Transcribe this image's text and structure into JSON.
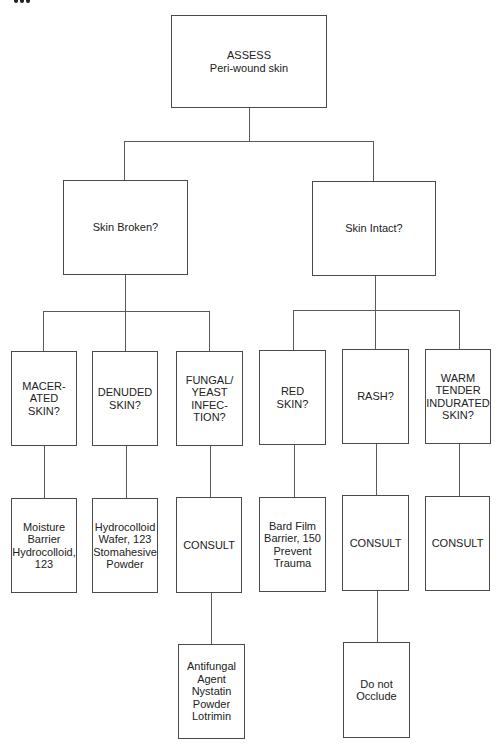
{
  "diagram": {
    "type": "flowchart",
    "title_fragment": "cropped text (illegible)",
    "nodes": [
      {
        "id": "assess",
        "label": "ASSESS\nPeri-wound skin",
        "level": 0
      },
      {
        "id": "skin_broken",
        "label": "Skin Broken?",
        "level": 1,
        "parent": "assess"
      },
      {
        "id": "skin_intact",
        "label": "Skin Intact?",
        "level": 1,
        "parent": "assess"
      },
      {
        "id": "macerated",
        "label": "MACER-\nATED\nSKIN?",
        "level": 2,
        "parent": "skin_broken"
      },
      {
        "id": "denuded",
        "label": "DENUDED\nSKIN?",
        "level": 2,
        "parent": "skin_broken"
      },
      {
        "id": "fungal",
        "label": "FUNGAL/\nYEAST\nINFEC-\nTION?",
        "level": 2,
        "parent": "skin_broken"
      },
      {
        "id": "red",
        "label": "RED\nSKIN?",
        "level": 2,
        "parent": "skin_intact"
      },
      {
        "id": "rash",
        "label": "RASH?",
        "level": 2,
        "parent": "skin_intact"
      },
      {
        "id": "warm",
        "label": "WARM\nTENDER\nINDURATED\nSKIN?",
        "level": 2,
        "parent": "skin_intact"
      },
      {
        "id": "moisture",
        "label": "Moisture\nBarrier\nHydrocolloid,\n123",
        "level": 3,
        "parent": "macerated"
      },
      {
        "id": "hydrocolloid",
        "label": "Hydrocolloid\nWafer, 123\nStomahesive\nPowder",
        "level": 3,
        "parent": "denuded"
      },
      {
        "id": "consult_fungal",
        "label": "CONSULT",
        "level": 3,
        "parent": "fungal"
      },
      {
        "id": "bard",
        "label": "Bard Film\nBarrier, 150\nPrevent\nTrauma",
        "level": 3,
        "parent": "red"
      },
      {
        "id": "consult_rash",
        "label": "CONSULT",
        "level": 3,
        "parent": "rash"
      },
      {
        "id": "consult_warm",
        "label": "CONSULT",
        "level": 3,
        "parent": "warm"
      },
      {
        "id": "antifungal",
        "label": "Antifungal\nAgent\nNystatin\nPowder\nLotrimin",
        "level": 4,
        "parent": "consult_fungal"
      },
      {
        "id": "occlude",
        "label": "Do not\nOcclude",
        "level": 4,
        "parent": "consult_rash"
      }
    ]
  },
  "colors": {
    "line": "#5a5a5a",
    "border": "#4a4a4a",
    "text": "#222222",
    "background": "#ffffff"
  }
}
